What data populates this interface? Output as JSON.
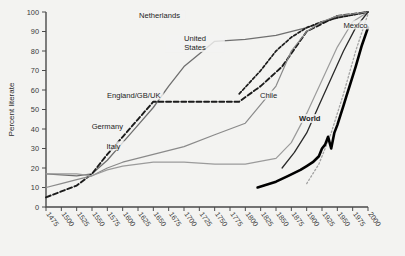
{
  "chart_data": {
    "type": "line",
    "title": "",
    "xlabel": "",
    "ylabel": "Percent literate",
    "xlim": [
      1475,
      2000
    ],
    "ylim": [
      0,
      100
    ],
    "grid": false,
    "legend_position": "inline-annotations",
    "xticks": [
      1475,
      1500,
      1525,
      1550,
      1575,
      1600,
      1625,
      1650,
      1675,
      1700,
      1725,
      1750,
      1775,
      1800,
      1825,
      1850,
      1875,
      1900,
      1925,
      1950,
      1975,
      2000
    ],
    "yticks": [
      0,
      10,
      20,
      30,
      40,
      50,
      60,
      70,
      80,
      90,
      100
    ],
    "series": [
      {
        "name": "Netherlands",
        "style": "solid-gray",
        "color": "#6f6f6f",
        "label_x": 1660,
        "label_y": 97,
        "x": [
          1475,
          1500,
          1525,
          1550,
          1575,
          1600,
          1625,
          1650,
          1675,
          1700,
          1750,
          1800,
          1850,
          1900,
          1950,
          2000
        ],
        "y": [
          17,
          16.5,
          16,
          17,
          24,
          33,
          42,
          51,
          62,
          72,
          85,
          86,
          88,
          92,
          97,
          100
        ]
      },
      {
        "name": "England/GB/UK",
        "style": "dashed-black",
        "color": "#1b1b1b",
        "label_x": 1618,
        "label_y": 56,
        "x": [
          1475,
          1500,
          1525,
          1550,
          1575,
          1600,
          1625,
          1650,
          1675,
          1700,
          1750,
          1790,
          1825,
          1860,
          1900,
          1950,
          2000
        ],
        "y": [
          5,
          8,
          11,
          17,
          27,
          36,
          45,
          54,
          54,
          54,
          54,
          54,
          62,
          72,
          90,
          98,
          100
        ]
      },
      {
        "name": "United States",
        "style": "dashed-black-fine",
        "color": "#1b1b1b",
        "label_x": 1718,
        "label_y": 85,
        "x": [
          1790,
          1825,
          1850,
          1875,
          1900,
          1925,
          1950,
          2000
        ],
        "y": [
          58,
          70,
          80,
          87,
          92,
          95,
          97,
          100
        ]
      },
      {
        "name": "Germany",
        "style": "solid-gray-mid",
        "color": "#8a8a8a",
        "label_x": 1575,
        "label_y": 40,
        "x": [
          1475,
          1500,
          1525,
          1550,
          1575,
          1600,
          1650,
          1700,
          1750,
          1800,
          1850,
          1875,
          1900,
          1925,
          1950,
          2000
        ],
        "y": [
          10,
          12,
          14,
          16,
          20,
          23,
          27,
          31,
          37,
          43,
          62,
          80,
          90,
          95,
          98,
          100
        ]
      },
      {
        "name": "Italy",
        "style": "solid-gray-light",
        "color": "#9b9b9b",
        "label_x": 1585,
        "label_y": 30,
        "x": [
          1475,
          1500,
          1525,
          1550,
          1575,
          1600,
          1650,
          1700,
          1750,
          1800,
          1850,
          1875,
          1900,
          1925,
          1950,
          1975,
          2000
        ],
        "y": [
          17,
          17,
          17,
          16,
          19,
          21,
          23,
          23,
          22,
          22,
          25,
          33,
          48,
          65,
          82,
          95,
          100
        ]
      },
      {
        "name": "Chile",
        "style": "solid-black-thin",
        "color": "#2a2a2a",
        "label_x": 1838,
        "label_y": 56,
        "x": [
          1860,
          1880,
          1900,
          1920,
          1940,
          1960,
          1980,
          2000
        ],
        "y": [
          20,
          28,
          38,
          52,
          66,
          80,
          92,
          100
        ]
      },
      {
        "name": "Mexico",
        "style": "dotted-gray",
        "color": "#a2a2a2",
        "label_x": 1960,
        "label_y": 92,
        "x": [
          1900,
          1920,
          1940,
          1960,
          1980,
          2000
        ],
        "y": [
          12,
          22,
          38,
          58,
          80,
          99
        ]
      },
      {
        "name": "World",
        "style": "solid-black-bold",
        "color": "#000000",
        "label_x": 1905,
        "label_y": 44,
        "x": [
          1820,
          1850,
          1870,
          1890,
          1900,
          1910,
          1920,
          1925,
          1930,
          1935,
          1940,
          1945,
          1950,
          1955,
          1960,
          1965,
          1970,
          1980,
          1990,
          2000
        ],
        "y": [
          10,
          13,
          16,
          19,
          21,
          23,
          26,
          30,
          32,
          36,
          30,
          38,
          42,
          47,
          52,
          57,
          62,
          72,
          83,
          92
        ]
      }
    ]
  },
  "axis": {
    "ylabel": "Percent literate"
  }
}
